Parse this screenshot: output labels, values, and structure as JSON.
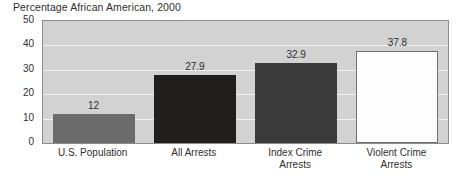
{
  "chart_data": {
    "type": "bar",
    "title": "Percentage African American, 2000",
    "xlabel": "",
    "ylabel": "",
    "ylim": [
      0,
      50
    ],
    "yticks": [
      0,
      10,
      20,
      30,
      40,
      50
    ],
    "ytick_labels": [
      "0",
      "10",
      "20",
      "30",
      "40",
      "50"
    ],
    "grid": true,
    "legend": "none",
    "categories": [
      "U.S. Population",
      "All Arrests",
      "Index Crime Arrests",
      "Violent Crime Arrests"
    ],
    "category_lines": [
      [
        "U.S. Population"
      ],
      [
        "All Arrests"
      ],
      [
        "Index Crime",
        "Arrests"
      ],
      [
        "Violent Crime",
        "Arrests"
      ]
    ],
    "values": [
      12,
      27.9,
      32.9,
      37.8
    ],
    "value_labels": [
      "12",
      "27.9",
      "32.9",
      "37.8"
    ],
    "bar_colors": [
      "#6b6b6b",
      "#211f1e",
      "#3b3b3b",
      "#fdfdfd"
    ],
    "bar_border_colors": [
      "#6b6b6b",
      "#211f1e",
      "#3b3b3b",
      "#6e6e6e"
    ],
    "plot_background": "#d2d2d2",
    "gridline_color": "#f2f2f2",
    "frame_color": "#8c8c8c",
    "text_color": "#2f2f2f"
  }
}
